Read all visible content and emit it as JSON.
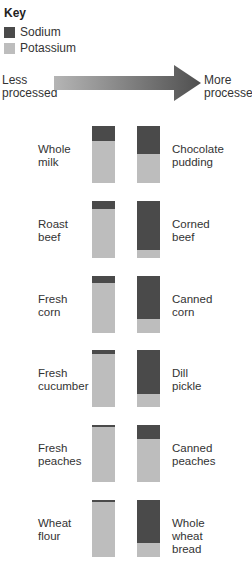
{
  "key": {
    "title": "Key",
    "items": [
      {
        "label": "Sodium",
        "color": "#4a4a4a"
      },
      {
        "label": "Potassium",
        "color": "#bdbdbd"
      }
    ]
  },
  "arrow": {
    "left_label_line1": "Less",
    "left_label_line2": "processed",
    "right_label_line1": "More",
    "right_label_line2": "processed",
    "gradient_start": "#b5b5b5",
    "gradient_end": "#4f4f4f"
  },
  "chart_data": {
    "type": "bar",
    "xlabel": "Less processed → More processed",
    "ylabel": "Proportion of combined sodium + potassium",
    "legend": [
      "Sodium",
      "Potassium"
    ],
    "legend_position": "top-left",
    "grid": false,
    "pairs": [
      {
        "less": "Whole milk",
        "more": "Chocolate pudding",
        "less_sodium_pct": 26,
        "more_sodium_pct": 49
      },
      {
        "less": "Roast beef",
        "more": "Corned beef",
        "less_sodium_pct": 14,
        "more_sodium_pct": 86
      },
      {
        "less": "Fresh corn",
        "more": "Canned corn",
        "less_sodium_pct": 13,
        "more_sodium_pct": 75
      },
      {
        "less": "Fresh cucumber",
        "more": "Dill pickle",
        "less_sodium_pct": 7,
        "more_sodium_pct": 77
      },
      {
        "less": "Fresh peaches",
        "more": "Canned peaches",
        "less_sodium_pct": 4,
        "more_sodium_pct": 25
      },
      {
        "less": "Wheat flour",
        "more": "Whole wheat bread",
        "less_sodium_pct": 4,
        "more_sodium_pct": 75
      }
    ],
    "categories": [
      "Whole milk",
      "Chocolate pudding",
      "Roast beef",
      "Corned beef",
      "Fresh corn",
      "Canned corn",
      "Fresh cucumber",
      "Dill pickle",
      "Fresh peaches",
      "Canned peaches",
      "Wheat flour",
      "Whole wheat bread"
    ],
    "series": [
      {
        "name": "Sodium",
        "values": [
          26,
          49,
          14,
          86,
          13,
          75,
          7,
          77,
          4,
          25,
          4,
          75
        ]
      },
      {
        "name": "Potassium",
        "values": [
          74,
          51,
          86,
          14,
          87,
          25,
          93,
          23,
          96,
          75,
          96,
          25
        ]
      }
    ]
  },
  "rows": [
    {
      "left": {
        "l1": "Whole",
        "l2": "milk",
        "l3": ""
      },
      "right": {
        "l1": "Chocolate",
        "l2": "pudding",
        "l3": ""
      }
    },
    {
      "left": {
        "l1": "Roast",
        "l2": "beef",
        "l3": ""
      },
      "right": {
        "l1": "Corned",
        "l2": "beef",
        "l3": ""
      }
    },
    {
      "left": {
        "l1": "Fresh",
        "l2": "corn",
        "l3": ""
      },
      "right": {
        "l1": "Canned",
        "l2": "corn",
        "l3": ""
      }
    },
    {
      "left": {
        "l1": "Fresh",
        "l2": "cucumber",
        "l3": ""
      },
      "right": {
        "l1": "Dill",
        "l2": "pickle",
        "l3": ""
      }
    },
    {
      "left": {
        "l1": "Fresh",
        "l2": "peaches",
        "l3": ""
      },
      "right": {
        "l1": "Canned",
        "l2": "peaches",
        "l3": ""
      }
    },
    {
      "left": {
        "l1": "Wheat",
        "l2": "flour",
        "l3": ""
      },
      "right": {
        "l1": "Whole",
        "l2": "wheat",
        "l3": "bread"
      }
    }
  ]
}
